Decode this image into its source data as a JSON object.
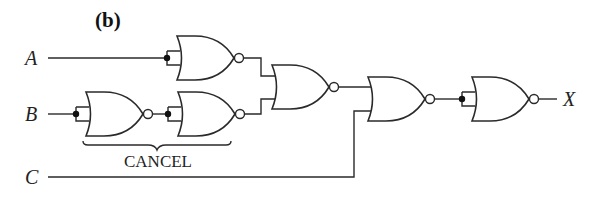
{
  "figure": {
    "title": "(b)",
    "inputs": [
      {
        "name": "A",
        "y": 58
      },
      {
        "name": "B",
        "y": 114
      },
      {
        "name": "C",
        "y": 177
      }
    ],
    "output": {
      "name": "X"
    },
    "brace_label": "CANCEL",
    "gates": [
      {
        "id": "nor-a",
        "type": "NOR",
        "inputs_tied": true,
        "input": "A"
      },
      {
        "id": "nor-b1",
        "type": "NOR",
        "inputs_tied": true,
        "input": "B"
      },
      {
        "id": "nor-b2",
        "type": "NOR",
        "inputs_tied": true,
        "input": "nor-b1"
      },
      {
        "id": "nor-mid",
        "type": "NOR",
        "inputs": [
          "nor-a",
          "nor-b2"
        ]
      },
      {
        "id": "nor-c",
        "type": "NOR",
        "inputs": [
          "nor-mid",
          "C"
        ]
      },
      {
        "id": "nor-out",
        "type": "NOR",
        "inputs_tied": true,
        "input": "nor-c",
        "output": "X"
      }
    ],
    "colors": {
      "line": "#2a2a2a",
      "background": "#ffffff"
    }
  }
}
